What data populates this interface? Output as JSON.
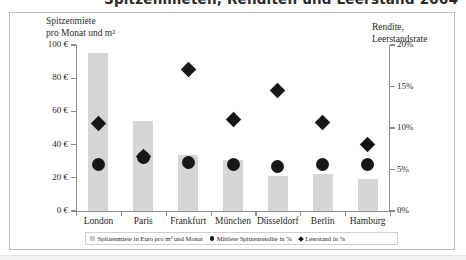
{
  "title": "Spitzenmieten, Renditen und Leerstand 2004",
  "axes": {
    "left_caption_line1": "Spitzenmiete",
    "left_caption_line2": "pro Monat und m²",
    "right_caption_line1": "Rendite,",
    "right_caption_line2": "Leerstandsrate"
  },
  "legend": {
    "items": [
      {
        "marker": "bar-swatch-icon",
        "label": "Spitzenmiete in Euro pro m² und Monat"
      },
      {
        "marker": "circle-marker-icon",
        "label": "Mittlere Spitzenrendite in %"
      },
      {
        "marker": "diamond-marker-icon",
        "label": "Leerstand in %"
      }
    ]
  },
  "chart_data": {
    "type": "bar",
    "title": "Spitzenmieten, Renditen und Leerstand 2004",
    "xlabel": "",
    "ylabel": "Spitzenmiete pro Monat und m²",
    "y2label": "Rendite, Leerstandsrate",
    "categories": [
      "London",
      "Paris",
      "Frankfurt",
      "München",
      "Düsseldorf",
      "Berlin",
      "Hamburg"
    ],
    "ylim": [
      0,
      100
    ],
    "y2lim": [
      0,
      20
    ],
    "yticklabels": [
      "0 €",
      "20 €",
      "40 €",
      "60 €",
      "80 €",
      "100 €"
    ],
    "ytickvalues": [
      0,
      20,
      40,
      60,
      80,
      100
    ],
    "y2ticklabels": [
      "0%",
      "5%",
      "10%",
      "15%",
      "20%"
    ],
    "y2tickvalues": [
      0,
      5,
      10,
      15,
      20
    ],
    "grid": false,
    "legend_position": "bottom",
    "series": [
      {
        "name": "Spitzenmiete in Euro pro m² und Monat",
        "type": "bar",
        "axis": "left",
        "unit": "€",
        "values": [
          95,
          54,
          34,
          31,
          21,
          22,
          19
        ]
      },
      {
        "name": "Mittlere Spitzenrendite in %",
        "type": "scatter",
        "marker": "circle",
        "axis": "right",
        "unit": "%",
        "values": [
          5.6,
          6.5,
          5.9,
          5.6,
          5.4,
          5.6,
          5.6
        ]
      },
      {
        "name": "Leerstand in %",
        "type": "scatter",
        "marker": "diamond",
        "axis": "right",
        "unit": "%",
        "values": [
          10.5,
          6.6,
          17.1,
          11.0,
          14.5,
          10.7,
          8.0
        ]
      }
    ]
  }
}
